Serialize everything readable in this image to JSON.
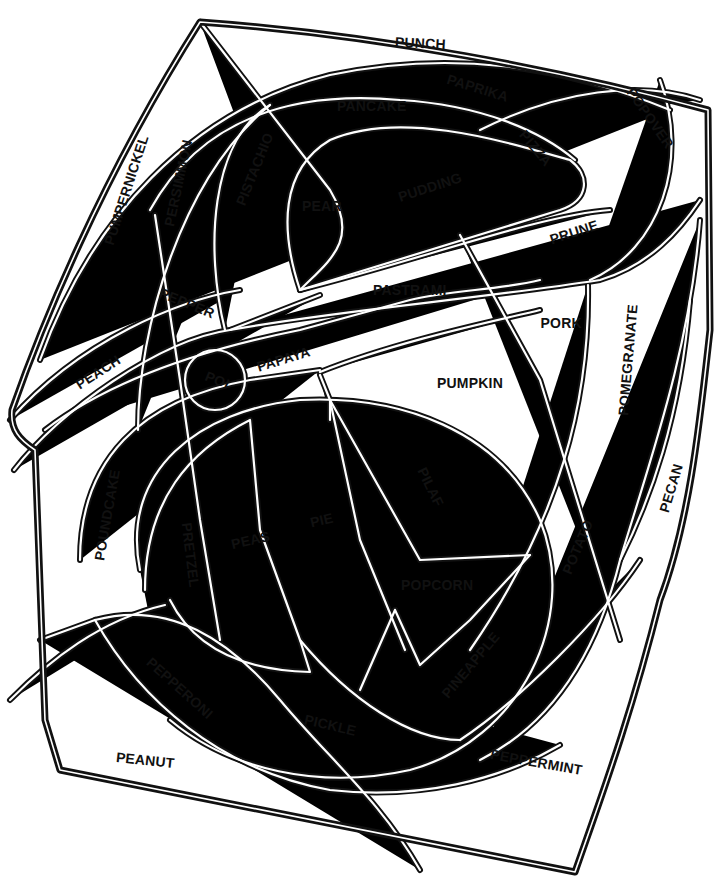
{
  "puzzle": {
    "type": "word-region line drawing",
    "line_color": "#111111",
    "background_color": "#ffffff",
    "regions": [
      {
        "label": "PUNCH",
        "x": 420,
        "y": 43,
        "rot": 3
      },
      {
        "label": "PAPRIKA",
        "x": 477,
        "y": 88,
        "rot": 17
      },
      {
        "label": "POPOVER",
        "x": 650,
        "y": 118,
        "rot": 55
      },
      {
        "label": "PANCAKE",
        "x": 372,
        "y": 106,
        "rot": 0
      },
      {
        "label": "PIZZA",
        "x": 535,
        "y": 148,
        "rot": 50
      },
      {
        "label": "PUMPERNICKEL",
        "x": 126,
        "y": 190,
        "rot": -72
      },
      {
        "label": "PERSIMMON",
        "x": 178,
        "y": 183,
        "rot": -78
      },
      {
        "label": "PISTACHIO",
        "x": 254,
        "y": 169,
        "rot": -68
      },
      {
        "label": "PEAR",
        "x": 322,
        "y": 206,
        "rot": 0
      },
      {
        "label": "PUDDING",
        "x": 430,
        "y": 187,
        "rot": -18
      },
      {
        "label": "PRUNE",
        "x": 574,
        "y": 232,
        "rot": -18
      },
      {
        "label": "PASTRAMI",
        "x": 410,
        "y": 290,
        "rot": 0
      },
      {
        "label": "PEPPER",
        "x": 187,
        "y": 303,
        "rot": 22
      },
      {
        "label": "PORK",
        "x": 561,
        "y": 323,
        "rot": 0
      },
      {
        "label": "POMEGRANATE",
        "x": 628,
        "y": 360,
        "rot": -85
      },
      {
        "label": "PEACH",
        "x": 98,
        "y": 372,
        "rot": -33
      },
      {
        "label": "PAPAYA",
        "x": 283,
        "y": 359,
        "rot": -17
      },
      {
        "label": "POI",
        "x": 217,
        "y": 380,
        "rot": 22
      },
      {
        "label": "PUMPKIN",
        "x": 470,
        "y": 383,
        "rot": 0
      },
      {
        "label": "PILAF",
        "x": 430,
        "y": 487,
        "rot": 64
      },
      {
        "label": "POUNDCAKE",
        "x": 107,
        "y": 515,
        "rot": -80
      },
      {
        "label": "PRETZEL",
        "x": 190,
        "y": 555,
        "rot": 83
      },
      {
        "label": "PEAS",
        "x": 250,
        "y": 540,
        "rot": -13
      },
      {
        "label": "PIE",
        "x": 321,
        "y": 520,
        "rot": -13
      },
      {
        "label": "POTATO",
        "x": 577,
        "y": 547,
        "rot": -67
      },
      {
        "label": "PECAN",
        "x": 671,
        "y": 488,
        "rot": -73
      },
      {
        "label": "POPCORN",
        "x": 437,
        "y": 585,
        "rot": 0
      },
      {
        "label": "PINEAPPLE",
        "x": 470,
        "y": 665,
        "rot": -50
      },
      {
        "label": "PEPPERONI",
        "x": 180,
        "y": 688,
        "rot": 42
      },
      {
        "label": "PICKLE",
        "x": 330,
        "y": 725,
        "rot": 13
      },
      {
        "label": "PEANUT",
        "x": 145,
        "y": 760,
        "rot": 6
      },
      {
        "label": "PEPPERMINT",
        "x": 536,
        "y": 762,
        "rot": 10
      }
    ]
  }
}
